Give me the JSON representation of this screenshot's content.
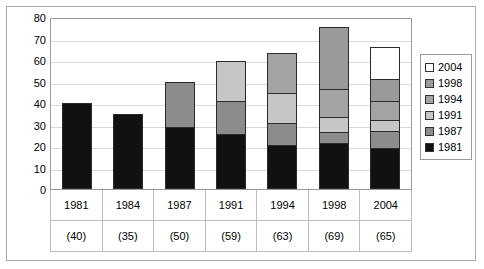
{
  "chart_data": {
    "type": "bar",
    "stacked": true,
    "title": "",
    "xlabel": "",
    "ylabel": "",
    "ylim": [
      0,
      80
    ],
    "yticks": [
      0,
      10,
      20,
      30,
      40,
      50,
      60,
      70,
      80
    ],
    "ytick_labels": [
      "0",
      "10",
      "20",
      "30",
      "40",
      "50",
      "60",
      "70",
      "80"
    ],
    "grid": true,
    "legend_position": "right",
    "categories": [
      "1981",
      "1984",
      "1987",
      "1991",
      "1994",
      "1998",
      "2004"
    ],
    "category_totals": [
      "(40)",
      "(35)",
      "(50)",
      "(59)",
      "(63)",
      "(69)",
      "(65)"
    ],
    "totals": [
      40,
      35,
      50,
      59,
      63,
      69,
      65
    ],
    "series": [
      {
        "name": "1981",
        "color": "#111111",
        "values": [
          40,
          35,
          29,
          25.5,
          20.5,
          21.5,
          19
        ]
      },
      {
        "name": "1987",
        "color": "#8c8c8c",
        "values": [
          0,
          0,
          21,
          15.5,
          10,
          5,
          8
        ]
      },
      {
        "name": "1991",
        "color": "#c6c6c6",
        "values": [
          0,
          0,
          0,
          18.5,
          14,
          7,
          5
        ]
      },
      {
        "name": "1994",
        "color": "#a3a3a3",
        "values": [
          0,
          0,
          0,
          0,
          19,
          13,
          9
        ]
      },
      {
        "name": "1998",
        "color": "#9a9a9a",
        "values": [
          0,
          0,
          0,
          0,
          0,
          29,
          10
        ]
      },
      {
        "name": "2004",
        "color": "#ffffff",
        "values": [
          0,
          0,
          0,
          0,
          0,
          0,
          15
        ]
      }
    ],
    "legend_entries": [
      {
        "label": "2004",
        "color": "#ffffff"
      },
      {
        "label": "1998",
        "color": "#9a9a9a"
      },
      {
        "label": "1994",
        "color": "#a3a3a3"
      },
      {
        "label": "1991",
        "color": "#c6c6c6"
      },
      {
        "label": "1987",
        "color": "#8c8c8c"
      },
      {
        "label": "1981",
        "color": "#111111"
      }
    ]
  }
}
